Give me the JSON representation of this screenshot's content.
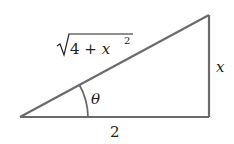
{
  "diagram": {
    "type": "right-triangle",
    "stroke_color": "#6b6b6b",
    "background": "#ffffff",
    "vertices": {
      "left": [
        20,
        117
      ],
      "right_bottom": [
        209,
        117
      ],
      "right_top": [
        209,
        15
      ]
    },
    "labels": {
      "hypotenuse_radicand": "4 + x",
      "hypotenuse_exponent": "2",
      "opposite": "x",
      "adjacent": "2",
      "angle": "θ"
    }
  }
}
